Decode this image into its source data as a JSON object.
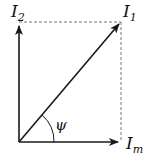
{
  "diagram": {
    "type": "phasor-diagram",
    "colors": {
      "stroke": "#1a1a1a",
      "dashed": "#777777",
      "background": "#ffffff"
    },
    "vectors": [
      {
        "name": "I2",
        "label_main": "I",
        "label_sub": "2",
        "direction": "vertical"
      },
      {
        "name": "I1",
        "label_main": "I",
        "label_sub": "1",
        "direction": "diagonal (resultant)"
      },
      {
        "name": "Im",
        "label_main": "I",
        "label_sub": "m",
        "direction": "horizontal"
      }
    ],
    "angle": {
      "symbol": "ψ",
      "between": [
        "Im",
        "I1"
      ]
    },
    "projections": "dashed lines from tip of I1 to I2 axis and Im axis"
  }
}
